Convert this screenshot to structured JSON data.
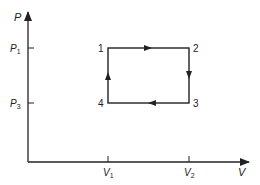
{
  "diagram": {
    "type": "pv-cycle",
    "axes": {
      "y_label": "P",
      "x_label": "V",
      "y_ticks": [
        {
          "label": "P",
          "sub": "1"
        },
        {
          "label": "P",
          "sub": "3"
        }
      ],
      "x_ticks": [
        {
          "label": "V",
          "sub": "1"
        },
        {
          "label": "V",
          "sub": "2"
        }
      ]
    },
    "points": [
      {
        "id": "1",
        "V": "V1",
        "P": "P1"
      },
      {
        "id": "2",
        "V": "V2",
        "P": "P1"
      },
      {
        "id": "3",
        "V": "V2",
        "P": "P3"
      },
      {
        "id": "4",
        "V": "V1",
        "P": "P3"
      }
    ],
    "path_order": [
      "1",
      "2",
      "3",
      "4",
      "1"
    ],
    "line_color": "#222222"
  }
}
